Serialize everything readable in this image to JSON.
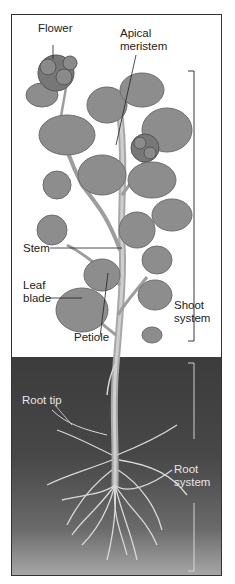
{
  "figure": {
    "cutoff_caption": "",
    "labels": {
      "flower": "Flower",
      "apical_meristem_line1": "Apical",
      "apical_meristem_line2": "meristem",
      "stem": "Stem",
      "leaf_blade_line1": "Leaf",
      "leaf_blade_line2": "blade",
      "petiole": "Petiole",
      "shoot_system_line1": "Shoot",
      "shoot_system_line2": "system",
      "root_tip": "Root tip",
      "root_system_line1": "Root",
      "root_system_line2": "system"
    },
    "colors": {
      "leaf": "#8a8a8a",
      "leaf_dark": "#6e6e6e",
      "stem": "#b5b5b5",
      "soil": "#444444",
      "root": "#d9d9d9",
      "line": "#222222"
    }
  }
}
